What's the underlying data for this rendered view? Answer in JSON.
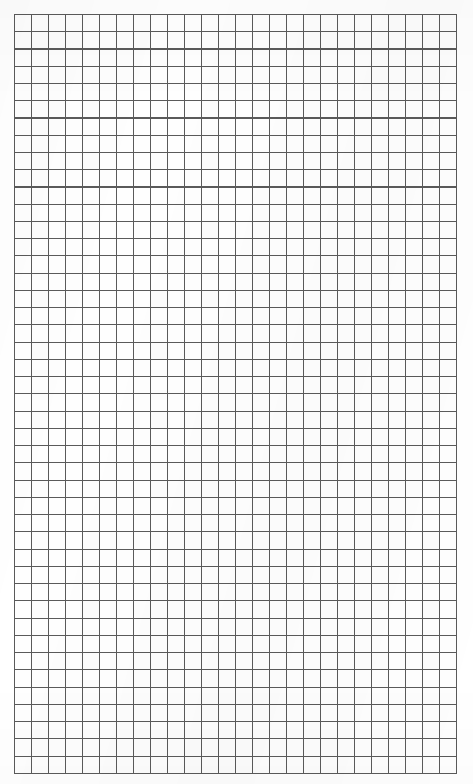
{
  "document": {
    "kind": "grid-paper-sheet",
    "title": "Blank Graph Paper Sheet",
    "page_width_px": 473,
    "page_height_px": 784,
    "background_color": "#ffffff"
  },
  "grid": {
    "name": "square-grid",
    "columns": 26,
    "rows": 44,
    "cell_width_px": 17,
    "cell_height_px": 17.25,
    "origin_x_px": 14,
    "origin_y_px": 14,
    "width_px": 442,
    "height_px": 759,
    "line_color": "#5a5a5a",
    "line_width_px": 1,
    "paper_color": "#fefefe",
    "has_border": true,
    "has_labels": false,
    "has_text": false,
    "has_axis_ticks": false,
    "major_lines_every": 0
  },
  "content": {
    "visible_text": "",
    "annotations": []
  }
}
